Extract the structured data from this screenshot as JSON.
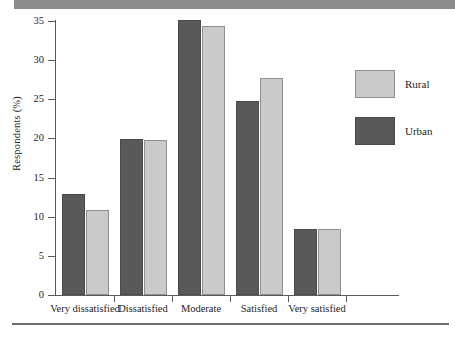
{
  "figure": {
    "top_rule_color": "#8c8c8c",
    "bottom_rule_color": "#6e6e70"
  },
  "chart_data": {
    "type": "bar",
    "title": "",
    "subtitle": "",
    "xlabel": "",
    "ylabel": "Respondents (%)",
    "ylim": [
      0,
      35
    ],
    "yticks": [
      0,
      5,
      10,
      15,
      20,
      25,
      30,
      35
    ],
    "ytick_labels": [
      "0",
      "5",
      "10",
      "15",
      "20",
      "25",
      "30",
      "35"
    ],
    "grid": false,
    "legend_position": "right",
    "categories": [
      "Very dissatisfied",
      "Dissatisfied",
      "Moderate",
      "Satisfied",
      "Very satisfied"
    ],
    "series": [
      {
        "name": "Urban",
        "color": "#59595b",
        "values": [
          12.9,
          19.9,
          35.1,
          24.8,
          8.4
        ]
      },
      {
        "name": "Rural",
        "color": "#cacac8",
        "values": [
          10.8,
          19.8,
          34.4,
          27.7,
          8.4
        ]
      }
    ],
    "legend": [
      {
        "label": "Rural",
        "color": "#cacac8"
      },
      {
        "label": "Urban",
        "color": "#59595b"
      }
    ]
  }
}
